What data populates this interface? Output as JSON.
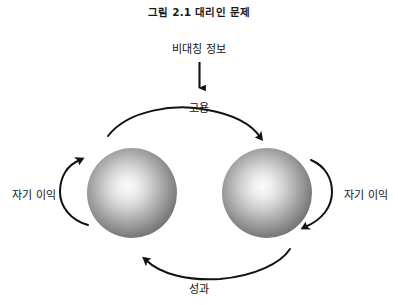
{
  "figure": {
    "title": "그림 2.1  대리인 문제",
    "background_color": "#ffffff",
    "width": 398,
    "height": 305
  },
  "labels": {
    "asymmetric_information": "비대칭 정보",
    "employment": "고용",
    "performance": "성과",
    "self_interest_left": "자기 이익",
    "self_interest_right": "자기 이익"
  },
  "nodes": [
    {
      "name": "principal-sphere",
      "shape": "sphere",
      "cx": 132,
      "cy": 193,
      "r": 45,
      "fill_center": "#f2f2f2",
      "fill_edge": "#6e6e6e"
    },
    {
      "name": "agent-sphere",
      "shape": "sphere",
      "cx": 267,
      "cy": 193,
      "r": 45,
      "fill_center": "#f2f2f2",
      "fill_edge": "#6e6e6e"
    }
  ],
  "arrows": [
    {
      "name": "asymmetric-information-arrow",
      "style": "straight",
      "direction": "down",
      "from": "비대칭 정보",
      "to": "고용"
    },
    {
      "name": "employment-arrow",
      "style": "curved-arc-over",
      "direction": "left-to-right",
      "label": "고용"
    },
    {
      "name": "performance-arrow",
      "style": "curved-arc-under",
      "direction": "right-to-left",
      "label": "성과"
    },
    {
      "name": "self-interest-left-arrow",
      "style": "c-arc",
      "direction": "counterclockwise",
      "label": "자기 이익"
    },
    {
      "name": "self-interest-right-arrow",
      "style": "c-arc",
      "direction": "clockwise",
      "label": "자기 이익"
    }
  ],
  "colors": {
    "stroke": "#111111",
    "text": "#111111",
    "title": "#1a1a1a"
  }
}
